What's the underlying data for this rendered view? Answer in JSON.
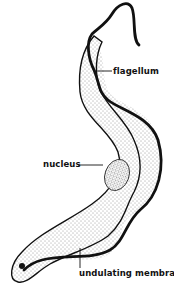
{
  "diagram": {
    "colors": {
      "ink": "#111111",
      "background": "#ffffff",
      "stipple": "#333333"
    },
    "labels": [
      {
        "id": "flagellum",
        "text": "flagellum"
      },
      {
        "id": "nucleus",
        "text": "nucleus"
      },
      {
        "id": "undulating-membrane",
        "text": "undulating membrane"
      }
    ]
  }
}
